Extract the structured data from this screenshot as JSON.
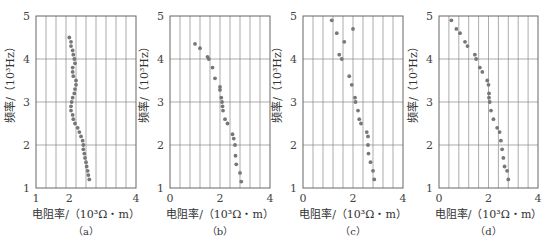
{
  "figure": {
    "ylabel": "频率/（10³Hz）",
    "xlabel": "电阻率/（10³Ω・m）"
  },
  "chart_data": [
    {
      "id": "a",
      "caption": "（a）",
      "type": "scatter",
      "xlabel": "电阻率/（10³Ω・m）",
      "ylabel": "频率/（10³Hz）",
      "xlim": [
        1,
        4
      ],
      "ylim": [
        1,
        5
      ],
      "xticks": [
        "1",
        "2",
        "4"
      ],
      "xtick_values": [
        1,
        2,
        4
      ],
      "yticks": [
        "1",
        "2",
        "3",
        "4",
        "5"
      ],
      "grid": true,
      "points": [
        [
          2.0,
          4.5
        ],
        [
          2.05,
          4.4
        ],
        [
          2.05,
          4.3
        ],
        [
          2.1,
          4.2
        ],
        [
          2.12,
          4.1
        ],
        [
          2.15,
          4.0
        ],
        [
          2.17,
          3.9
        ],
        [
          2.1,
          3.8
        ],
        [
          2.1,
          3.7
        ],
        [
          2.12,
          3.6
        ],
        [
          2.2,
          3.5
        ],
        [
          2.2,
          3.4
        ],
        [
          2.17,
          3.3
        ],
        [
          2.15,
          3.2
        ],
        [
          2.1,
          3.1
        ],
        [
          2.07,
          3.0
        ],
        [
          2.05,
          2.9
        ],
        [
          2.05,
          2.8
        ],
        [
          2.1,
          2.7
        ],
        [
          2.12,
          2.6
        ],
        [
          2.17,
          2.5
        ],
        [
          2.25,
          2.4
        ],
        [
          2.3,
          2.3
        ],
        [
          2.35,
          2.2
        ],
        [
          2.4,
          2.1
        ],
        [
          2.42,
          2.0
        ],
        [
          2.42,
          1.9
        ],
        [
          2.45,
          1.8
        ],
        [
          2.47,
          1.7
        ],
        [
          2.5,
          1.6
        ],
        [
          2.52,
          1.5
        ],
        [
          2.55,
          1.4
        ],
        [
          2.57,
          1.3
        ],
        [
          2.6,
          1.2
        ]
      ]
    },
    {
      "id": "b",
      "caption": "（b）",
      "type": "scatter",
      "xlabel": "电阻率/（10³Ω・m）",
      "ylabel": "频率/（10³Hz）",
      "xlim": [
        0,
        4
      ],
      "ylim": [
        1,
        5
      ],
      "xticks": [
        "0",
        "2",
        "4"
      ],
      "xtick_values": [
        0,
        2,
        4
      ],
      "yticks": [
        "1",
        "2",
        "3",
        "4",
        "5"
      ],
      "grid": true,
      "points": [
        [
          1.0,
          4.35
        ],
        [
          1.2,
          4.25
        ],
        [
          1.5,
          4.05
        ],
        [
          1.55,
          4.0
        ],
        [
          1.7,
          3.8
        ],
        [
          1.8,
          3.55
        ],
        [
          2.0,
          3.35
        ],
        [
          2.0,
          3.28
        ],
        [
          2.05,
          3.1
        ],
        [
          2.08,
          3.0
        ],
        [
          2.1,
          2.9
        ],
        [
          2.12,
          2.8
        ],
        [
          2.2,
          2.6
        ],
        [
          2.3,
          2.5
        ],
        [
          2.5,
          2.25
        ],
        [
          2.55,
          2.15
        ],
        [
          2.6,
          2.0
        ],
        [
          2.62,
          1.75
        ],
        [
          2.65,
          1.55
        ],
        [
          2.8,
          1.35
        ],
        [
          2.85,
          1.15
        ]
      ]
    },
    {
      "id": "c",
      "caption": "（c）",
      "type": "scatter",
      "xlabel": "电阻率/（10³Ω・m）",
      "ylabel": "频率/（10³Hz）",
      "xlim": [
        0,
        4
      ],
      "ylim": [
        1,
        5
      ],
      "xticks": [
        "0",
        "2",
        "4"
      ],
      "xtick_values": [
        0,
        2,
        4
      ],
      "yticks": [
        "1",
        "2",
        "3",
        "4",
        "5"
      ],
      "grid": true,
      "points": [
        [
          1.15,
          4.9
        ],
        [
          1.35,
          4.6
        ],
        [
          2.0,
          4.7
        ],
        [
          1.65,
          4.4
        ],
        [
          1.45,
          4.1
        ],
        [
          1.55,
          4.0
        ],
        [
          1.85,
          3.6
        ],
        [
          1.95,
          3.4
        ],
        [
          2.08,
          3.1
        ],
        [
          2.1,
          3.0
        ],
        [
          2.2,
          2.8
        ],
        [
          2.25,
          2.6
        ],
        [
          2.32,
          2.5
        ],
        [
          2.55,
          2.3
        ],
        [
          2.6,
          2.2
        ],
        [
          2.6,
          2.0
        ],
        [
          2.62,
          1.8
        ],
        [
          2.7,
          1.6
        ],
        [
          2.8,
          1.4
        ],
        [
          2.85,
          1.2
        ]
      ]
    },
    {
      "id": "d",
      "caption": "（d）",
      "type": "scatter",
      "xlabel": "电阻率/（10³Ω・m）",
      "ylabel": "频率/（10³Hz）",
      "xlim": [
        0,
        4
      ],
      "ylim": [
        1,
        5
      ],
      "xticks": [
        "0",
        "2",
        "4"
      ],
      "xtick_values": [
        0,
        2,
        4
      ],
      "yticks": [
        "1",
        "2",
        "3",
        "4",
        "5"
      ],
      "grid": true,
      "points": [
        [
          0.5,
          4.9
        ],
        [
          0.7,
          4.7
        ],
        [
          0.85,
          4.6
        ],
        [
          1.05,
          4.4
        ],
        [
          1.15,
          4.3
        ],
        [
          1.45,
          4.1
        ],
        [
          1.5,
          4.0
        ],
        [
          1.65,
          3.8
        ],
        [
          1.75,
          3.7
        ],
        [
          1.95,
          3.5
        ],
        [
          2.0,
          3.4
        ],
        [
          2.02,
          3.2
        ],
        [
          2.02,
          3.1
        ],
        [
          2.05,
          3.0
        ],
        [
          2.1,
          2.8
        ],
        [
          2.2,
          2.6
        ],
        [
          2.35,
          2.4
        ],
        [
          2.45,
          2.3
        ],
        [
          2.5,
          2.1
        ],
        [
          2.55,
          1.9
        ],
        [
          2.6,
          1.7
        ],
        [
          2.65,
          1.5
        ],
        [
          2.75,
          1.4
        ],
        [
          2.8,
          1.2
        ]
      ]
    }
  ],
  "layout": {
    "panels": [
      {
        "x0": 36,
        "x1": 136
      },
      {
        "x0": 170,
        "x1": 270
      },
      {
        "x0": 303,
        "x1": 403
      },
      {
        "x0": 439,
        "x1": 538
      }
    ],
    "y_top": 16,
    "y_bottom": 188,
    "point_color": "#777777",
    "grid_color": "#888888"
  }
}
